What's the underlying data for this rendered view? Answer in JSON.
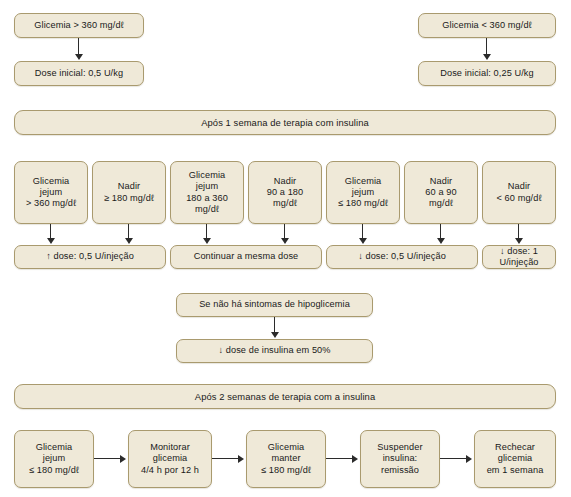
{
  "diagram": {
    "colors": {
      "box_fill": "#efe9d8",
      "box_border": "#a99a6e",
      "connector": "#2b2b2b",
      "background": "#ffffff",
      "text": "#1a1a1a"
    }
  },
  "top": {
    "left_branch": {
      "condition": "Glicemia > 360 mg/dℓ",
      "action": "Dose inicial: 0,5 U/kg"
    },
    "right_branch": {
      "condition": "Glicemia < 360 mg/dℓ",
      "action": "Dose inicial: 0,25 U/kg"
    }
  },
  "banner_week1": "Após 1 semana de terapia com insulina",
  "conditions_week1": [
    "Glicemia\njejum\n> 360 mg/dℓ",
    "Nadir\n≥ 180 mg/dℓ",
    "Glicemia\njejum\n180 a 360\nmg/dℓ",
    "Nadir\n90 a 180\nmg/dℓ",
    "Glicemia\njejum\n≤ 180 mg/dℓ",
    "Nadir\n60 a 90\nmg/dℓ",
    "Nadir\n< 60 mg/dℓ"
  ],
  "actions_week1": [
    "↑ dose: 0,5 U/injeção",
    "Continuar a mesma dose",
    "↓ dose: 0,5 U/injeção",
    "↓ dose: 1 U/injeção"
  ],
  "hypo": {
    "condition": "Se não há sintomas de hipoglicemia",
    "action": "↓ dose de insulina em 50%"
  },
  "banner_week2": "Após 2 semanas de terapia com a insulina",
  "sequence_week2": [
    "Glicemia\njejum\n≤ 180 mg/dℓ",
    "Monitorar\nglicemia\n4/4 h por 12 h",
    "Glicemia\nmanter\n≤ 180 mg/dℓ",
    "Suspender\ninsulina:\nremissão",
    "Rechecar\nglicemia\nem 1 semana"
  ]
}
